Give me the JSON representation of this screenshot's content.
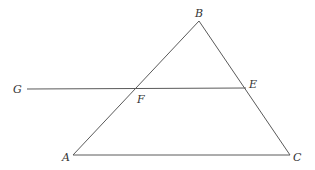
{
  "diagram": {
    "type": "geometry",
    "colors": {
      "line": "#5a5a5a",
      "label": "#333333",
      "background": "#ffffff"
    },
    "points": {
      "A": {
        "label": "A",
        "x": 73,
        "y": 155,
        "label_x": 62,
        "label_y": 161
      },
      "B": {
        "label": "B",
        "x": 199,
        "y": 21,
        "label_x": 195,
        "label_y": 17
      },
      "C": {
        "label": "C",
        "x": 290,
        "y": 155,
        "label_x": 293,
        "label_y": 161
      },
      "E": {
        "label": "E",
        "x": 246,
        "y": 88,
        "label_x": 249,
        "label_y": 88
      },
      "F": {
        "label": "F",
        "x": 136,
        "y": 89,
        "label_x": 137,
        "label_y": 103
      },
      "G": {
        "label": "G",
        "x": 27,
        "y": 89,
        "label_x": 13,
        "label_y": 93
      }
    },
    "segments": [
      {
        "name": "AB",
        "from": "A",
        "to": "B"
      },
      {
        "name": "BC",
        "from": "B",
        "to": "C"
      },
      {
        "name": "AC",
        "from": "A",
        "to": "C"
      },
      {
        "name": "GE",
        "from": "G",
        "to": "E"
      }
    ]
  }
}
